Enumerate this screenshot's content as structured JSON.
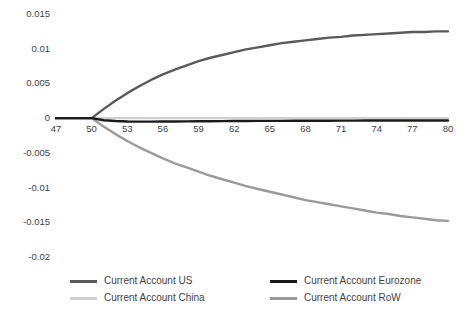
{
  "chart_data": {
    "type": "line",
    "title": "",
    "xlabel": "",
    "ylabel": "",
    "xlim": [
      47,
      80
    ],
    "ylim": [
      -0.02,
      0.015
    ],
    "grid": false,
    "legend_position": "bottom",
    "x_ticks": [
      "47",
      "50",
      "53",
      "56",
      "59",
      "62",
      "65",
      "68",
      "71",
      "74",
      "77",
      "80"
    ],
    "y_ticks": [
      "0.015",
      "0.01",
      "0.005",
      "0",
      "-0.005",
      "-0.01",
      "-0.015",
      "-0.02"
    ],
    "x": [
      47,
      48,
      49,
      50,
      51,
      52,
      53,
      54,
      55,
      56,
      57,
      58,
      59,
      60,
      61,
      62,
      63,
      64,
      65,
      66,
      67,
      68,
      69,
      70,
      71,
      72,
      73,
      74,
      75,
      76,
      77,
      78,
      79,
      80
    ],
    "series": [
      {
        "name": "Current Account US",
        "color": "#5a5a5a",
        "width": 2.4,
        "values": [
          0,
          0,
          0,
          0,
          0.0013,
          0.0025,
          0.0036,
          0.0046,
          0.0055,
          0.0063,
          0.007,
          0.0076,
          0.0082,
          0.0087,
          0.0091,
          0.0095,
          0.0099,
          0.0102,
          0.0105,
          0.0108,
          0.011,
          0.0112,
          0.0114,
          0.0116,
          0.0117,
          0.0119,
          0.012,
          0.0121,
          0.0122,
          0.0123,
          0.0124,
          0.0124,
          0.0125,
          0.0125
        ]
      },
      {
        "name": "Current Account China",
        "color": "#d0d0d0",
        "width": 2.4,
        "values": [
          0,
          0,
          0,
          0,
          0,
          0,
          0,
          0,
          0,
          0,
          0,
          0,
          0,
          0,
          0,
          0,
          0,
          0,
          0,
          0,
          0,
          0,
          0,
          0,
          0,
          0,
          0,
          0,
          0,
          0,
          0,
          0,
          0,
          0
        ]
      },
      {
        "name": "Current Account Eurozone",
        "color": "#1a1a1a",
        "width": 2.4,
        "values": [
          0,
          0,
          0,
          0,
          -0.0003,
          -0.00042,
          -0.00048,
          -0.0005,
          -0.0005,
          -0.00049,
          -0.00048,
          -0.00046,
          -0.00045,
          -0.00044,
          -0.00043,
          -0.00042,
          -0.00041,
          -0.0004,
          -0.0004,
          -0.00039,
          -0.00038,
          -0.00038,
          -0.00037,
          -0.00037,
          -0.00036,
          -0.00036,
          -0.00035,
          -0.00035,
          -0.00035,
          -0.00034,
          -0.00034,
          -0.00034,
          -0.00033,
          -0.00033
        ]
      },
      {
        "name": "Current Account RoW",
        "color": "#9a9a9a",
        "width": 2.4,
        "values": [
          0,
          0,
          0,
          0,
          -0.0012,
          -0.0023,
          -0.0033,
          -0.0042,
          -0.005,
          -0.0058,
          -0.0065,
          -0.0071,
          -0.0077,
          -0.0083,
          -0.0088,
          -0.0093,
          -0.0098,
          -0.0102,
          -0.0106,
          -0.011,
          -0.0114,
          -0.0118,
          -0.0121,
          -0.0124,
          -0.0127,
          -0.013,
          -0.0133,
          -0.0136,
          -0.0138,
          -0.0141,
          -0.0143,
          -0.0145,
          -0.0147,
          -0.0148
        ]
      }
    ]
  }
}
